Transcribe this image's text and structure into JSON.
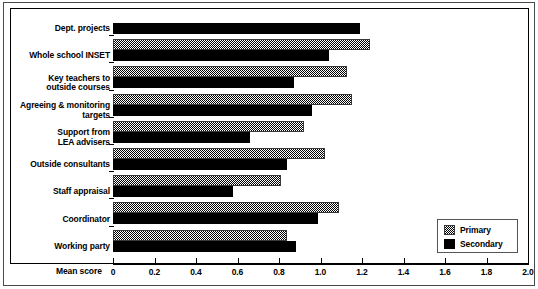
{
  "chart_data": {
    "type": "bar",
    "orientation": "horizontal",
    "title": "",
    "xlabel": "Mean score",
    "ylabel": "",
    "xlim": [
      0,
      2.0
    ],
    "xticks": [
      "0",
      "0.2",
      "0.4",
      "0.6",
      "0.8",
      "1.0",
      "1.2",
      "1.4",
      "1.6",
      "1.8",
      "2.0"
    ],
    "xtick_values": [
      0,
      0.2,
      0.4,
      0.6,
      0.8,
      1.0,
      1.2,
      1.4,
      1.6,
      1.8,
      2.0
    ],
    "grid": false,
    "legend_position": "bottom-right",
    "categories": [
      "Dept. projects",
      "Whole school INSET",
      "Key teachers to\noutside courses",
      "Agreeing & monitoring\ntargets",
      "Support from\nLEA advisers",
      "Outside consultants",
      "Staff appraisal",
      "Coordinator",
      "Working party"
    ],
    "series": [
      {
        "name": "Primary",
        "color": "#808080",
        "pattern": "checkered",
        "values": [
          null,
          1.24,
          1.13,
          1.15,
          0.92,
          1.02,
          0.81,
          1.09,
          0.84
        ]
      },
      {
        "name": "Secondary",
        "color": "#000000",
        "pattern": "solid",
        "values": [
          1.19,
          1.04,
          0.87,
          0.96,
          0.66,
          0.84,
          0.58,
          0.99,
          0.88
        ]
      }
    ]
  },
  "legend": {
    "items": [
      {
        "label": "Primary",
        "style": "checkered"
      },
      {
        "label": "Secondary",
        "style": "solid"
      }
    ]
  }
}
